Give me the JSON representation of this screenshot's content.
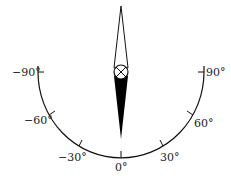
{
  "diagram": {
    "type": "compass-dial",
    "scale_labels": {
      "neg90": "−90°",
      "neg60": "−60°",
      "neg30": "−30°",
      "zero": "0°",
      "pos30": "30°",
      "pos60": "60°",
      "pos90": "90°"
    },
    "colors": {
      "stroke": "#111111",
      "needle_fill": "#000000",
      "background": "#ffffff"
    }
  }
}
